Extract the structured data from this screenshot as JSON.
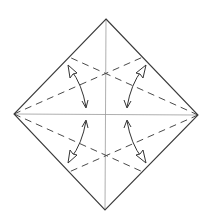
{
  "diagram": {
    "type": "origami-fold-diagram",
    "colors": {
      "background": "#ffffff",
      "outline": "#3a3a3a",
      "crease": "#9a9a9a",
      "valley_fold": "#4a4a4a",
      "arrow": "#333333"
    },
    "vertices": {
      "top": [
        106,
        19
      ],
      "right": [
        198,
        115
      ],
      "bottom": [
        105,
        210
      ],
      "left": [
        14,
        114
      ]
    },
    "creases": [
      {
        "name": "vertical-center-crease",
        "from": [
          106,
          19
        ],
        "to": [
          105,
          210
        ]
      },
      {
        "name": "horizontal-center-crease",
        "from": [
          14,
          114
        ],
        "to": [
          198,
          115
        ]
      }
    ],
    "valley_folds": [
      {
        "name": "valley-fold-left-to-upper-right",
        "from": [
          14,
          114
        ],
        "to": [
          143,
          57
        ]
      },
      {
        "name": "valley-fold-left-to-lower-right",
        "from": [
          14,
          114
        ],
        "to": [
          143,
          172
        ]
      },
      {
        "name": "valley-fold-right-to-upper-left",
        "from": [
          198,
          115
        ],
        "to": [
          69,
          57
        ]
      },
      {
        "name": "valley-fold-right-to-lower-left",
        "from": [
          198,
          115
        ],
        "to": [
          69,
          172
        ]
      }
    ],
    "arrows": [
      {
        "name": "fold-arrow-upper-left",
        "open_tip": [
          68,
          65
        ],
        "line_tip": [
          86,
          108
        ]
      },
      {
        "name": "fold-arrow-upper-right",
        "open_tip": [
          146,
          65
        ],
        "line_tip": [
          127,
          108
        ]
      },
      {
        "name": "fold-arrow-lower-left",
        "open_tip": [
          68,
          163
        ],
        "line_tip": [
          86,
          120
        ]
      },
      {
        "name": "fold-arrow-lower-right",
        "open_tip": [
          146,
          163
        ],
        "line_tip": [
          127,
          120
        ]
      }
    ]
  }
}
